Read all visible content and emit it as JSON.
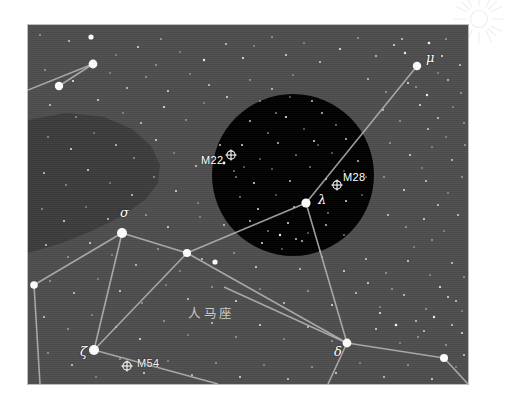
{
  "chart": {
    "title_cn": "人马座",
    "panel": {
      "x": 28,
      "y": 25,
      "width": 440,
      "height": 359
    },
    "colors": {
      "page_background": "#ffffff",
      "sky": "#4d4d4d",
      "dark_nebula": "#3c3c3c",
      "eyepiece_field": "#000000",
      "constellation_line": "#b8b8b8",
      "star": "#ffffff",
      "label_text": "#ffffff",
      "constellation_name_text": "#c9c9c9",
      "panel_border": "#bdbdbd",
      "watermark": "#f0f0f0"
    }
  },
  "chart_data": {
    "type": "scatter",
    "title": "人马座",
    "xlabel": "",
    "ylabel": "",
    "grid": false,
    "legend_position": "none",
    "xlim": [
      0,
      440
    ],
    "ylim": [
      0,
      359
    ],
    "eyepiece_field": {
      "label": "telescope-field-circle",
      "cx": 265,
      "cy": 150,
      "r": 81,
      "fill": "#000000"
    },
    "dark_nebula": {
      "label": "dark-nebula-lane",
      "fill": "#3c3c3c",
      "path": "M 0 95 L 38 88 L 76 92 L 104 104 L 123 121 L 132 140 L 130 158 L 118 174 L 96 190 L 66 205 L 34 218 L 0 228 Z"
    },
    "named_stars": [
      {
        "name": "mu",
        "label": "μ",
        "x": 389,
        "y": 41,
        "mag_radius": 4.2,
        "label_dx": 9,
        "label_dy": -9
      },
      {
        "name": "sigma",
        "label": "σ",
        "x": 94,
        "y": 208,
        "mag_radius": 5.0,
        "label_dx": -2,
        "label_dy": -21
      },
      {
        "name": "lambda",
        "label": "λ",
        "x": 278,
        "y": 178,
        "mag_radius": 4.6,
        "label_dx": 12,
        "label_dy": -4
      },
      {
        "name": "zeta",
        "label": "ζ",
        "x": 66,
        "y": 325,
        "mag_radius": 5.0,
        "label_dx": -14,
        "label_dy": 1
      },
      {
        "name": "delta",
        "label": "δ",
        "x": 319,
        "y": 318,
        "mag_radius": 4.4,
        "label_dx": -13,
        "label_dy": 8
      }
    ],
    "unnamed_bright_stars": [
      {
        "x": 65,
        "y": 39,
        "mag_radius": 4.4
      },
      {
        "x": 31,
        "y": 61,
        "mag_radius": 4.2
      },
      {
        "x": 159,
        "y": 228,
        "mag_radius": 4.0
      },
      {
        "x": 6,
        "y": 260,
        "mag_radius": 3.8
      },
      {
        "x": 187,
        "y": 237,
        "mag_radius": 2.6
      },
      {
        "x": 416,
        "y": 333,
        "mag_radius": 4.0
      },
      {
        "x": 63,
        "y": 12,
        "mag_radius": 2.6
      }
    ],
    "messier_objects": [
      {
        "name": "M22",
        "label": "M22",
        "x": 203,
        "y": 130,
        "label_dx": -30,
        "label_dy": 6,
        "on": "dark"
      },
      {
        "name": "M28",
        "label": "M28",
        "x": 309,
        "y": 160,
        "label_dx": 6,
        "label_dy": -7,
        "on": "dark"
      },
      {
        "name": "M54",
        "label": "M54",
        "x": 99,
        "y": 341,
        "label_dx": 10,
        "label_dy": -2,
        "on": "sky"
      }
    ],
    "constellation_lines": [
      {
        "from": "edge-left",
        "x1": 0,
        "y1": 65,
        "x2": 65,
        "y2": 39
      },
      {
        "from": "star-a",
        "x1": 65,
        "y1": 39,
        "x2": 31,
        "y2": 61
      },
      {
        "from": "mu",
        "x1": 389,
        "y1": 41,
        "x2": 278,
        "y2": 178
      },
      {
        "from": "lambda-sw",
        "x1": 278,
        "y1": 178,
        "x2": 159,
        "y2": 228
      },
      {
        "from": "lambda-s",
        "x1": 278,
        "y1": 178,
        "x2": 319,
        "y2": 318
      },
      {
        "from": "sigma-e",
        "x1": 94,
        "y1": 208,
        "x2": 159,
        "y2": 228
      },
      {
        "from": "sigma-w",
        "x1": 94,
        "y1": 208,
        "x2": 6,
        "y2": 260
      },
      {
        "from": "sigma-s",
        "x1": 94,
        "y1": 208,
        "x2": 66,
        "y2": 325
      },
      {
        "from": "westedge-s",
        "x1": 6,
        "y1": 260,
        "x2": 12,
        "y2": 359
      },
      {
        "from": "node-se",
        "x1": 159,
        "y1": 228,
        "x2": 319,
        "y2": 318
      },
      {
        "from": "zeta-e",
        "x1": 66,
        "y1": 325,
        "x2": 190,
        "y2": 359
      },
      {
        "from": "zeta-ne",
        "x1": 66,
        "y1": 325,
        "x2": 159,
        "y2": 228
      },
      {
        "from": "delta-e",
        "x1": 319,
        "y1": 318,
        "x2": 416,
        "y2": 333
      },
      {
        "from": "delta-s",
        "x1": 319,
        "y1": 318,
        "x2": 300,
        "y2": 359
      },
      {
        "from": "delta-w",
        "x1": 319,
        "y1": 318,
        "x2": 196,
        "y2": 262
      },
      {
        "from": "east-edge",
        "x1": 416,
        "y1": 333,
        "x2": 440,
        "y2": 359
      }
    ],
    "field_stars": [
      [
        12,
        10,
        0.8
      ],
      [
        41,
        16,
        0.9
      ],
      [
        63,
        12,
        1.4
      ],
      [
        88,
        30,
        0.7
      ],
      [
        110,
        22,
        1.0
      ],
      [
        133,
        14,
        0.8
      ],
      [
        128,
        40,
        0.8
      ],
      [
        152,
        27,
        0.7
      ],
      [
        176,
        35,
        1.2
      ],
      [
        198,
        19,
        0.9
      ],
      [
        215,
        33,
        1.1
      ],
      [
        226,
        21,
        0.7
      ],
      [
        244,
        12,
        0.8
      ],
      [
        258,
        30,
        1.0
      ],
      [
        276,
        18,
        0.7
      ],
      [
        292,
        37,
        0.9
      ],
      [
        312,
        24,
        1.1
      ],
      [
        330,
        13,
        0.8
      ],
      [
        348,
        31,
        0.9
      ],
      [
        366,
        20,
        1.0
      ],
      [
        401,
        18,
        1.3
      ],
      [
        414,
        31,
        1.0
      ],
      [
        418,
        14,
        0.8
      ],
      [
        432,
        40,
        0.9
      ],
      [
        377,
        28,
        1.2
      ],
      [
        374,
        14,
        0.9
      ],
      [
        17,
        45,
        0.8
      ],
      [
        45,
        56,
        1.1
      ],
      [
        82,
        48,
        0.7
      ],
      [
        99,
        63,
        0.9
      ],
      [
        118,
        52,
        0.8
      ],
      [
        140,
        66,
        1.0
      ],
      [
        162,
        49,
        0.7
      ],
      [
        181,
        60,
        0.9
      ],
      [
        199,
        72,
        1.0
      ],
      [
        222,
        55,
        0.8
      ],
      [
        244,
        64,
        0.9
      ],
      [
        265,
        50,
        0.7
      ],
      [
        340,
        54,
        0.9
      ],
      [
        358,
        67,
        0.8
      ],
      [
        380,
        58,
        1.0
      ],
      [
        399,
        70,
        1.2
      ],
      [
        420,
        55,
        0.9
      ],
      [
        433,
        68,
        0.8
      ],
      [
        388,
        62,
        0.8
      ],
      [
        410,
        48,
        0.7
      ],
      [
        22,
        80,
        0.9
      ],
      [
        48,
        92,
        0.8
      ],
      [
        70,
        75,
        1.0
      ],
      [
        95,
        88,
        0.7
      ],
      [
        113,
        98,
        0.9
      ],
      [
        136,
        82,
        1.1
      ],
      [
        158,
        95,
        0.8
      ],
      [
        176,
        78,
        0.7
      ],
      [
        355,
        85,
        0.9
      ],
      [
        372,
        96,
        0.8
      ],
      [
        392,
        80,
        1.0
      ],
      [
        410,
        93,
        0.9
      ],
      [
        425,
        82,
        0.7
      ],
      [
        436,
        98,
        0.8
      ],
      [
        400,
        104,
        0.9
      ],
      [
        418,
        112,
        0.7
      ],
      [
        20,
        112,
        0.8
      ],
      [
        43,
        124,
        1.0
      ],
      [
        66,
        108,
        0.7
      ],
      [
        88,
        120,
        0.9
      ],
      [
        106,
        133,
        0.8
      ],
      [
        128,
        115,
        1.0
      ],
      [
        146,
        128,
        0.7
      ],
      [
        168,
        141,
        0.9
      ],
      [
        362,
        118,
        0.8
      ],
      [
        382,
        130,
        1.0
      ],
      [
        404,
        122,
        0.7
      ],
      [
        424,
        135,
        0.9
      ],
      [
        437,
        120,
        0.8
      ],
      [
        394,
        143,
        0.7
      ],
      [
        16,
        148,
        0.9
      ],
      [
        38,
        160,
        0.8
      ],
      [
        60,
        145,
        1.0
      ],
      [
        82,
        158,
        0.7
      ],
      [
        104,
        170,
        0.9
      ],
      [
        126,
        152,
        0.8
      ],
      [
        148,
        166,
        1.0
      ],
      [
        170,
        178,
        0.7
      ],
      [
        356,
        152,
        0.8
      ],
      [
        376,
        165,
        1.0
      ],
      [
        398,
        156,
        0.9
      ],
      [
        420,
        168,
        0.7
      ],
      [
        434,
        152,
        0.8
      ],
      [
        410,
        180,
        0.9
      ],
      [
        14,
        184,
        0.8
      ],
      [
        36,
        196,
        1.0
      ],
      [
        58,
        182,
        0.7
      ],
      [
        80,
        194,
        0.9
      ],
      [
        118,
        190,
        0.8
      ],
      [
        140,
        202,
        1.0
      ],
      [
        172,
        192,
        0.7
      ],
      [
        196,
        200,
        0.9
      ],
      [
        214,
        186,
        0.8
      ],
      [
        360,
        190,
        0.9
      ],
      [
        378,
        202,
        0.8
      ],
      [
        396,
        194,
        1.0
      ],
      [
        416,
        206,
        0.7
      ],
      [
        430,
        190,
        0.9
      ],
      [
        404,
        215,
        0.8
      ],
      [
        386,
        222,
        0.7
      ],
      [
        18,
        220,
        0.9
      ],
      [
        40,
        232,
        0.8
      ],
      [
        62,
        218,
        1.0
      ],
      [
        84,
        230,
        0.7
      ],
      [
        108,
        240,
        0.9
      ],
      [
        130,
        224,
        0.8
      ],
      [
        152,
        246,
        0.7
      ],
      [
        174,
        234,
        0.9
      ],
      [
        206,
        228,
        0.8
      ],
      [
        228,
        242,
        1.0
      ],
      [
        250,
        230,
        0.7
      ],
      [
        272,
        244,
        0.9
      ],
      [
        294,
        232,
        0.8
      ],
      [
        316,
        246,
        1.0
      ],
      [
        338,
        234,
        0.9
      ],
      [
        358,
        248,
        0.8
      ],
      [
        380,
        236,
        1.0
      ],
      [
        402,
        250,
        0.7
      ],
      [
        424,
        238,
        0.9
      ],
      [
        436,
        252,
        0.8
      ],
      [
        22,
        256,
        0.8
      ],
      [
        46,
        268,
        0.9
      ],
      [
        70,
        254,
        0.7
      ],
      [
        92,
        266,
        1.0
      ],
      [
        114,
        278,
        0.8
      ],
      [
        138,
        260,
        0.7
      ],
      [
        160,
        274,
        0.9
      ],
      [
        184,
        262,
        0.8
      ],
      [
        208,
        276,
        1.0
      ],
      [
        232,
        264,
        0.7
      ],
      [
        256,
        278,
        0.9
      ],
      [
        280,
        266,
        0.8
      ],
      [
        304,
        280,
        1.0
      ],
      [
        328,
        268,
        0.9
      ],
      [
        352,
        282,
        0.7
      ],
      [
        376,
        270,
        0.9
      ],
      [
        398,
        284,
        0.8
      ],
      [
        420,
        272,
        1.0
      ],
      [
        434,
        286,
        0.7
      ],
      [
        16,
        292,
        0.9
      ],
      [
        40,
        304,
        0.8
      ],
      [
        64,
        290,
        0.7
      ],
      [
        88,
        302,
        0.9
      ],
      [
        112,
        314,
        1.0
      ],
      [
        136,
        296,
        0.8
      ],
      [
        160,
        310,
        0.7
      ],
      [
        184,
        298,
        0.9
      ],
      [
        208,
        312,
        0.8
      ],
      [
        232,
        300,
        1.0
      ],
      [
        256,
        314,
        0.7
      ],
      [
        280,
        302,
        0.9
      ],
      [
        304,
        316,
        0.8
      ],
      [
        348,
        304,
        1.0
      ],
      [
        372,
        318,
        0.7
      ],
      [
        396,
        306,
        0.9
      ],
      [
        418,
        320,
        0.8
      ],
      [
        434,
        308,
        1.0
      ],
      [
        20,
        328,
        0.8
      ],
      [
        44,
        340,
        0.9
      ],
      [
        68,
        352,
        0.7
      ],
      [
        92,
        334,
        0.8
      ],
      [
        116,
        348,
        1.0
      ],
      [
        140,
        336,
        0.7
      ],
      [
        164,
        350,
        0.9
      ],
      [
        188,
        338,
        0.8
      ],
      [
        212,
        352,
        1.0
      ],
      [
        236,
        340,
        0.7
      ],
      [
        260,
        354,
        0.9
      ],
      [
        284,
        342,
        0.8
      ],
      [
        308,
        348,
        1.0
      ],
      [
        332,
        338,
        0.7
      ],
      [
        356,
        352,
        0.9
      ],
      [
        380,
        340,
        0.8
      ],
      [
        404,
        354,
        1.0
      ],
      [
        428,
        342,
        0.7
      ],
      [
        436,
        330,
        0.9
      ],
      [
        368,
        300,
        1.3
      ],
      [
        388,
        296,
        0.9
      ],
      [
        352,
        288,
        1.1
      ],
      [
        340,
        258,
        1.0
      ],
      [
        364,
        264,
        0.8
      ],
      [
        406,
        292,
        1.2
      ],
      [
        424,
        300,
        0.9
      ],
      [
        390,
        312,
        0.8
      ],
      [
        412,
        262,
        1.1
      ],
      [
        428,
        276,
        0.9
      ]
    ],
    "field_stars_inside_circle": [
      [
        222,
        96,
        0.9
      ],
      [
        240,
        108,
        0.8
      ],
      [
        258,
        92,
        1.1
      ],
      [
        276,
        104,
        0.7
      ],
      [
        294,
        88,
        0.9
      ],
      [
        308,
        100,
        0.8
      ],
      [
        214,
        120,
        1.0
      ],
      [
        232,
        134,
        0.7
      ],
      [
        250,
        118,
        0.9
      ],
      [
        268,
        130,
        0.8
      ],
      [
        286,
        116,
        1.0
      ],
      [
        304,
        128,
        0.7
      ],
      [
        318,
        114,
        0.9
      ],
      [
        206,
        146,
        0.8
      ],
      [
        226,
        158,
        1.0
      ],
      [
        244,
        144,
        0.7
      ],
      [
        262,
        156,
        0.9
      ],
      [
        282,
        142,
        0.8
      ],
      [
        298,
        154,
        1.0
      ],
      [
        316,
        146,
        0.7
      ],
      [
        330,
        136,
        0.9
      ],
      [
        212,
        172,
        0.8
      ],
      [
        230,
        184,
        1.0
      ],
      [
        248,
        170,
        0.7
      ],
      [
        266,
        182,
        0.9
      ],
      [
        300,
        188,
        0.8
      ],
      [
        318,
        176,
        1.0
      ],
      [
        334,
        170,
        0.7
      ],
      [
        222,
        196,
        0.9
      ],
      [
        240,
        206,
        0.8
      ],
      [
        260,
        198,
        1.0
      ],
      [
        280,
        208,
        0.7
      ],
      [
        298,
        200,
        0.9
      ],
      [
        316,
        210,
        0.8
      ],
      [
        234,
        218,
        1.0
      ],
      [
        254,
        224,
        0.7
      ],
      [
        274,
        216,
        0.9
      ],
      [
        292,
        226,
        0.8
      ],
      [
        248,
        88,
        0.8
      ],
      [
        284,
        76,
        0.9
      ],
      [
        262,
        72,
        0.7
      ],
      [
        196,
        138,
        1.4
      ],
      [
        208,
        152,
        0.8
      ],
      [
        216,
        142,
        0.7
      ],
      [
        192,
        120,
        0.9
      ],
      [
        338,
        152,
        0.8
      ],
      [
        252,
        210,
        1.2
      ],
      [
        268,
        214,
        0.9
      ],
      [
        290,
        120,
        0.7
      ],
      [
        232,
        76,
        0.8
      ]
    ]
  },
  "labels": {
    "messier_glyph": "⊕",
    "constellation_name": "人马座"
  }
}
